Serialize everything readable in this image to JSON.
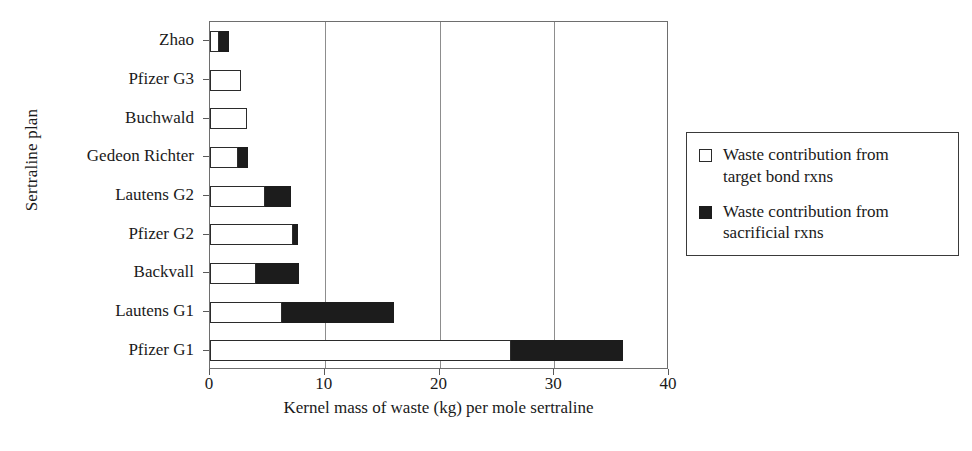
{
  "chart_data": {
    "type": "bar",
    "orientation": "horizontal",
    "stacked": true,
    "title": "",
    "xlabel": "Kernel mass of waste (kg) per mole sertraline",
    "ylabel": "Sertraline plan",
    "xlim": [
      0,
      40
    ],
    "xticks": [
      0,
      10,
      20,
      30,
      40
    ],
    "xticklabels": [
      "0",
      "10",
      "20",
      "30",
      "40"
    ],
    "grid": "vertical",
    "legend_position": "right",
    "categories": [
      "Zhao",
      "Pfizer G3",
      "Buchwald",
      "Gedeon Richter",
      "Lautens G2",
      "Pfizer G2",
      "Backvall",
      "Lautens G1",
      "Pfizer G1"
    ],
    "series": [
      {
        "name": "Waste contribution from target bond rxns",
        "color": "#ffffff",
        "values": [
          0.8,
          2.7,
          3.2,
          2.4,
          4.8,
          7.2,
          4.0,
          6.3,
          26.2
        ]
      },
      {
        "name": "Waste contribution from sacrificial rxns",
        "color": "#1c1c1c",
        "values": [
          0.9,
          0.0,
          0.0,
          0.9,
          2.3,
          0.5,
          3.8,
          9.7,
          9.8
        ]
      }
    ],
    "totals": [
      1.7,
      2.7,
      3.2,
      3.3,
      7.1,
      7.7,
      7.8,
      16.0,
      36.0
    ]
  },
  "legend": {
    "entries": [
      {
        "swatch": "white",
        "line1": "Waste contribution from",
        "line2": "target bond rxns"
      },
      {
        "swatch": "black",
        "line1": "Waste contribution from",
        "line2": "sacrificial rxns"
      }
    ]
  }
}
